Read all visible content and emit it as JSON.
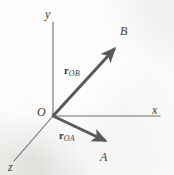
{
  "figure": {
    "kind": "3d-coordinate-vector-diagram",
    "background_color": "#f1f0ee",
    "axis_color": "#6e6e6e",
    "vector_color": "#595959",
    "text_color": "#3a3a3a",
    "width": 174,
    "height": 175
  },
  "axes": [
    {
      "id": "y",
      "label": "y",
      "from": [
        53,
        116
      ],
      "to": [
        53,
        22
      ],
      "arrow": false
    },
    {
      "id": "x",
      "label": "x",
      "from": [
        53,
        116
      ],
      "to": [
        160,
        116
      ],
      "arrow": false
    },
    {
      "id": "z",
      "label": "z",
      "from": [
        53,
        116
      ],
      "to": [
        14,
        161
      ],
      "arrow": false
    }
  ],
  "origin": {
    "label": "O",
    "point": [
      53,
      116
    ]
  },
  "vectors": [
    {
      "id": "rOB",
      "symbol": "r",
      "subscript": "OB",
      "from": [
        53,
        116
      ],
      "to": [
        118,
        45
      ],
      "endpoint_label": "B"
    },
    {
      "id": "rOA",
      "symbol": "r",
      "subscript": "OA",
      "from": [
        53,
        116
      ],
      "to": [
        110,
        143
      ],
      "endpoint_label": "A"
    }
  ],
  "labels": {
    "axis_y": "y",
    "axis_x": "x",
    "axis_z": "z",
    "origin": "O",
    "point_b": "B",
    "point_a": "A",
    "vector_ob_symbol": "r",
    "vector_ob_subscript": "OB",
    "vector_oa_symbol": "r",
    "vector_oa_subscript": "OA"
  }
}
